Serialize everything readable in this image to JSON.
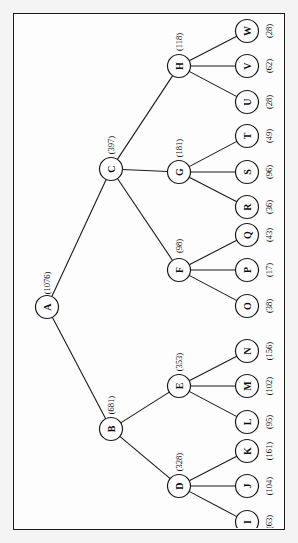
{
  "diagram": {
    "orientation": "rotated-90-ccw",
    "background_color": "#f4f4f4",
    "panel_color": "#fdfdfd",
    "line_color": "#1a1a1a",
    "node_fill": "#ffffff"
  },
  "chart_data": {
    "type": "tree",
    "value_format": "(n)",
    "root": "A",
    "nodes": [
      {
        "id": "A",
        "label": "A",
        "value": 1076,
        "value_label": "(1076)",
        "depth": 0,
        "parent": null
      },
      {
        "id": "B",
        "label": "B",
        "value": 681,
        "value_label": "(681)",
        "depth": 1,
        "parent": "A"
      },
      {
        "id": "C",
        "label": "C",
        "value": 397,
        "value_label": "(397)",
        "depth": 1,
        "parent": "A"
      },
      {
        "id": "D",
        "label": "D",
        "value": 328,
        "value_label": "(328)",
        "depth": 2,
        "parent": "B"
      },
      {
        "id": "E",
        "label": "E",
        "value": 353,
        "value_label": "(353)",
        "depth": 2,
        "parent": "B"
      },
      {
        "id": "F",
        "label": "F",
        "value": 98,
        "value_label": "(98)",
        "depth": 2,
        "parent": "C"
      },
      {
        "id": "G",
        "label": "G",
        "value": 181,
        "value_label": "(181)",
        "depth": 2,
        "parent": "C"
      },
      {
        "id": "H",
        "label": "H",
        "value": 118,
        "value_label": "(118)",
        "depth": 2,
        "parent": "C"
      },
      {
        "id": "I",
        "label": "I",
        "value": 63,
        "value_label": "(63)",
        "depth": 3,
        "parent": "D"
      },
      {
        "id": "J",
        "label": "J",
        "value": 104,
        "value_label": "(104)",
        "depth": 3,
        "parent": "D"
      },
      {
        "id": "K",
        "label": "K",
        "value": 161,
        "value_label": "(161)",
        "depth": 3,
        "parent": "D"
      },
      {
        "id": "L",
        "label": "L",
        "value": 95,
        "value_label": "(95)",
        "depth": 3,
        "parent": "E"
      },
      {
        "id": "M",
        "label": "M",
        "value": 102,
        "value_label": "(102)",
        "depth": 3,
        "parent": "E"
      },
      {
        "id": "N",
        "label": "N",
        "value": 156,
        "value_label": "(156)",
        "depth": 3,
        "parent": "E"
      },
      {
        "id": "O",
        "label": "O",
        "value": 38,
        "value_label": "(38)",
        "depth": 3,
        "parent": "F"
      },
      {
        "id": "P",
        "label": "P",
        "value": 17,
        "value_label": "(17)",
        "depth": 3,
        "parent": "F"
      },
      {
        "id": "Q",
        "label": "Q",
        "value": 43,
        "value_label": "(43)",
        "depth": 3,
        "parent": "F"
      },
      {
        "id": "R",
        "label": "R",
        "value": 36,
        "value_label": "(36)",
        "depth": 3,
        "parent": "G"
      },
      {
        "id": "S",
        "label": "S",
        "value": 96,
        "value_label": "(96)",
        "depth": 3,
        "parent": "G"
      },
      {
        "id": "T",
        "label": "T",
        "value": 49,
        "value_label": "(49)",
        "depth": 3,
        "parent": "G"
      },
      {
        "id": "U",
        "label": "U",
        "value": 28,
        "value_label": "(28)",
        "depth": 3,
        "parent": "H"
      },
      {
        "id": "V",
        "label": "V",
        "value": 62,
        "value_label": "(62)",
        "depth": 3,
        "parent": "H"
      },
      {
        "id": "W",
        "label": "W",
        "value": 28,
        "value_label": "(28)",
        "depth": 3,
        "parent": "H"
      }
    ],
    "edges": [
      [
        "A",
        "B"
      ],
      [
        "A",
        "C"
      ],
      [
        "B",
        "D"
      ],
      [
        "B",
        "E"
      ],
      [
        "C",
        "F"
      ],
      [
        "C",
        "G"
      ],
      [
        "C",
        "H"
      ],
      [
        "D",
        "I"
      ],
      [
        "D",
        "J"
      ],
      [
        "D",
        "K"
      ],
      [
        "E",
        "L"
      ],
      [
        "E",
        "M"
      ],
      [
        "E",
        "N"
      ],
      [
        "F",
        "O"
      ],
      [
        "F",
        "P"
      ],
      [
        "F",
        "Q"
      ],
      [
        "G",
        "R"
      ],
      [
        "G",
        "S"
      ],
      [
        "G",
        "T"
      ],
      [
        "H",
        "U"
      ],
      [
        "H",
        "V"
      ],
      [
        "H",
        "W"
      ]
    ],
    "layout": {
      "A": {
        "x": 33,
        "y": 293
      },
      "B": {
        "x": 97,
        "y": 415
      },
      "C": {
        "x": 97,
        "y": 155
      },
      "D": {
        "x": 165,
        "y": 472
      },
      "E": {
        "x": 165,
        "y": 372
      },
      "F": {
        "x": 165,
        "y": 256
      },
      "G": {
        "x": 165,
        "y": 158
      },
      "H": {
        "x": 165,
        "y": 52
      },
      "I": {
        "x": 233,
        "y": 508
      },
      "J": {
        "x": 233,
        "y": 472
      },
      "K": {
        "x": 233,
        "y": 437
      },
      "L": {
        "x": 233,
        "y": 408
      },
      "M": {
        "x": 233,
        "y": 372
      },
      "N": {
        "x": 233,
        "y": 337
      },
      "O": {
        "x": 233,
        "y": 292
      },
      "P": {
        "x": 233,
        "y": 256
      },
      "Q": {
        "x": 233,
        "y": 221
      },
      "R": {
        "x": 233,
        "y": 193
      },
      "S": {
        "x": 233,
        "y": 158
      },
      "T": {
        "x": 233,
        "y": 122
      },
      "U": {
        "x": 233,
        "y": 88
      },
      "V": {
        "x": 233,
        "y": 52
      },
      "W": {
        "x": 233,
        "y": 17
      }
    }
  }
}
